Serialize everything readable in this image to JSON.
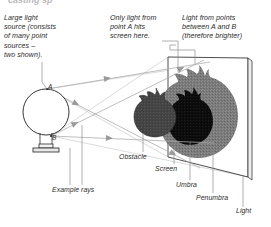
{
  "figure": {
    "title_partial": "casting sp",
    "background": "#ffffff",
    "ink": "#2b2b2b"
  },
  "labels": {
    "source": "Large light\nsource (consists\nof many point\nsources –\ntwo shown).",
    "point_a_note": "Only light from\npoint A hits\nscreen here.",
    "between_ab_note": "Light from points\nbetween A and B\n(therefore brighter)",
    "obstacle": "Obstacle",
    "screen": "Screen",
    "umbra": "Umbra",
    "penumbra": "Penumbra",
    "light": "Light",
    "example_rays": "Example rays",
    "point_a": "A",
    "point_b": "B"
  },
  "colors": {
    "umbra": "#0d0d0d",
    "penumbra": "#7a7a7a",
    "obstacle": "#454545",
    "ray": "#a8a8a8",
    "leader": "#8d8d8d",
    "outline": "#3a3a3a",
    "screen_face": "#ffffff"
  },
  "geometry": {
    "source_center": [
      46,
      112
    ],
    "source_radius": 23,
    "point_a": [
      47,
      89
    ],
    "point_b": [
      51,
      136
    ],
    "obstacle_center": [
      155,
      113
    ],
    "obstacle_radius": 19,
    "screen_quad": [
      [
        168,
        57
      ],
      [
        248,
        58
      ],
      [
        248,
        177
      ],
      [
        168,
        157
      ]
    ],
    "ray_count": 4
  }
}
